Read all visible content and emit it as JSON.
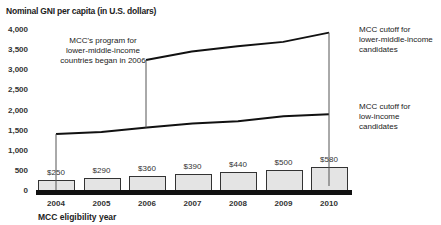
{
  "chart_data": {
    "type": "bar+line",
    "title": "Nominal GNI per capita (in U.S. dollars)",
    "xlabel": "MCC eligibility year",
    "ylabel": "Nominal GNI per capita (in U.S. dollars)",
    "ylim": [
      0,
      4000
    ],
    "yticks": [
      "0",
      "500",
      "1,000",
      "1,500",
      "2,000",
      "2,500",
      "3,000",
      "3,500",
      "4,000"
    ],
    "categories": [
      "2004",
      "2005",
      "2006",
      "2007",
      "2008",
      "2009",
      "2010"
    ],
    "grid": false,
    "series": [
      {
        "name": "Bars (dollar amounts)",
        "type": "bar",
        "values": [
          250,
          290,
          360,
          390,
          440,
          500,
          580
        ],
        "labels": [
          "$250",
          "$290",
          "$360",
          "$390",
          "$440",
          "$500",
          "$580"
        ]
      },
      {
        "name": "MCC cutoff for low-income candidates",
        "type": "line",
        "values": [
          1415,
          1465,
          1575,
          1675,
          1735,
          1855,
          1905
        ]
      },
      {
        "name": "MCC cutoff for lower-middle-income candidates",
        "type": "line",
        "values": [
          null,
          null,
          3255,
          3465,
          3595,
          3705,
          3935
        ]
      }
    ],
    "annotations": [
      "MCC's program for lower-middle-income countries began in 2006",
      "MCC cutoff for lower-middle-income candidates",
      "MCC cutoff for low-income candidates"
    ]
  },
  "text": {
    "title": "Nominal GNI per capita (in U.S. dollars)",
    "xlabel": "MCC eligibility year",
    "annot_program": [
      "MCC's program for",
      "lower-middle-income",
      "countries began in 2006"
    ],
    "annot_lmi": [
      "MCC cutoff for",
      "lower-middle-income",
      "candidates"
    ],
    "annot_li": [
      "MCC cutoff for",
      "low-income",
      "candidates"
    ]
  }
}
